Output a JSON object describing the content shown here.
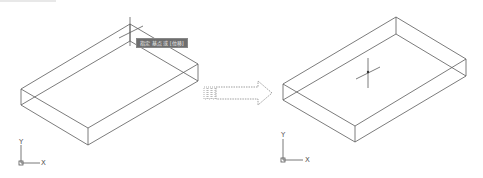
{
  "figure": {
    "left_panel": {
      "label": "before",
      "tooltip": "指定 基点 或 [位移]",
      "ucs": {
        "y_label": "Y",
        "x_label": "X"
      }
    },
    "arrow": {
      "icon": "dotted-right-arrow-icon"
    },
    "right_panel": {
      "label": "after",
      "ucs": {
        "y_label": "Y",
        "x_label": "X"
      }
    }
  }
}
